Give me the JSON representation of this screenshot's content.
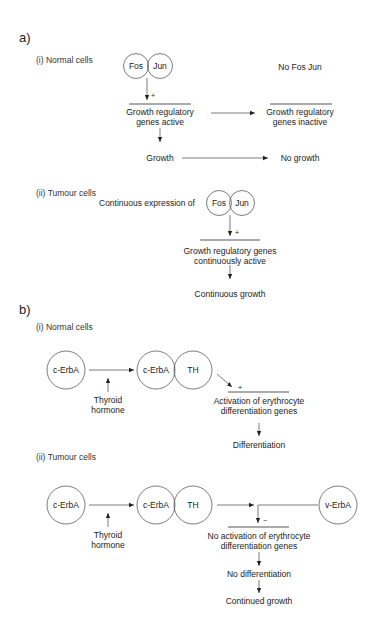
{
  "section_a": {
    "label": "a)",
    "normal": {
      "heading": "(i) Normal cells",
      "fos": "Fos",
      "jun": "Jun",
      "no_fos_jun": "No Fos Jun",
      "plus": "+",
      "active_1": "Growth regulatory",
      "active_2": "genes active",
      "inactive_1": "Growth regulatory",
      "inactive_2": "genes inactive",
      "growth": "Growth",
      "no_growth": "No growth"
    },
    "tumour": {
      "heading": "(ii) Tumour cells",
      "expression": "Continuous expression of",
      "fos": "Fos",
      "jun": "Jun",
      "plus": "+",
      "active_1": "Growth regulatory genes",
      "active_2": "continuously active",
      "growth": "Continuous growth"
    }
  },
  "section_b": {
    "label": "b)",
    "normal": {
      "heading": "(i) Normal cells",
      "c_erba": "c-ErbA",
      "c_erba_bound": "c-ErbA",
      "th": "TH",
      "hormone_1": "Thyroid",
      "hormone_2": "hormone",
      "plus": "+",
      "activation_1": "Activation of erythrocyte",
      "activation_2": "differentiation genes",
      "result": "Differentiation"
    },
    "tumour": {
      "heading": "(ii) Tumour cells",
      "c_erba": "c-ErbA",
      "c_erba_bound": "c-ErbA",
      "th": "TH",
      "v_erba": "v-ErbA",
      "hormone_1": "Thyroid",
      "hormone_2": "hormone",
      "minus": "−",
      "activation_1": "No activation of erythrocyte",
      "activation_2": "differentiation genes",
      "result_1": "No differentiation",
      "result_2": "Continued growth"
    }
  }
}
